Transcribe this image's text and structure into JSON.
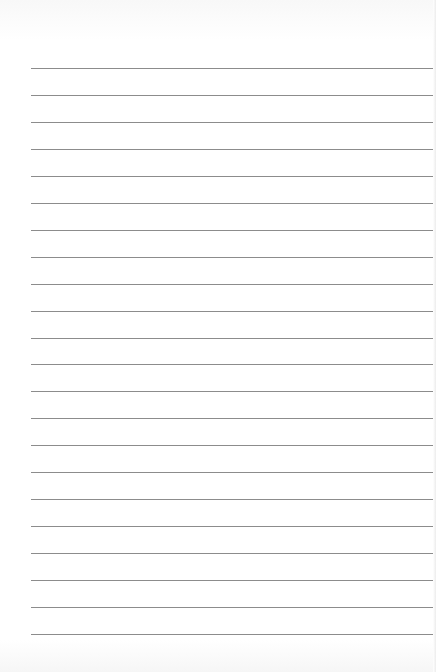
{
  "document": {
    "type": "ruled-paper",
    "line_count": 22,
    "line_color": "#8c8c8c",
    "background_color": "#ffffff",
    "text": []
  }
}
